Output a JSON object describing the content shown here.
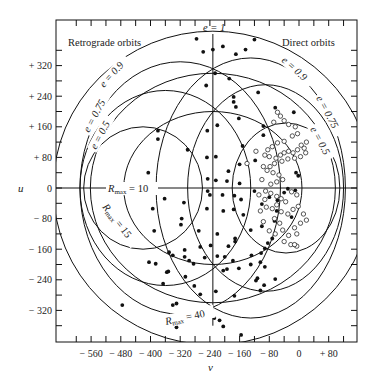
{
  "chart_data": {
    "type": "scatter",
    "title": "",
    "xlabel": "v",
    "ylabel": "u",
    "xlim": [
      -660,
      150
    ],
    "ylim": [
      -405,
      440
    ],
    "x_ticks": [
      -560,
      -480,
      -400,
      -320,
      -240,
      -160,
      -80,
      0,
      80
    ],
    "x_tick_labels": [
      "− 560",
      "− 480",
      "− 400",
      "− 320",
      "− 240",
      "− 160",
      "− 80",
      "0",
      "+ 80"
    ],
    "y_ticks": [
      320,
      240,
      160,
      80,
      0,
      -80,
      -160,
      -240,
      -320
    ],
    "y_tick_labels": [
      "+ 320",
      "+ 240",
      "+ 160",
      "+ 80",
      "0",
      "− 80",
      "− 160",
      "− 240",
      "− 320"
    ],
    "grid": false,
    "region_labels": {
      "retrograde": "Retrograde orbits",
      "direct": "Direct orbits"
    },
    "curve_labels": {
      "e1": "e = 1",
      "e09_left": "e = 0.9",
      "e075_left": "e = 0.75",
      "e05_left": "e = 0.5",
      "e09_right": "e = 0.9",
      "e075_right": "e = 0.75",
      "e05_right": "e = 0.5",
      "rmax10": "R",
      "rmax10_sub": "max",
      "rmax10_val": " = 10",
      "rmax15": "R",
      "rmax15_sub": "max",
      "rmax15_val": " = 15",
      "rmax40": "R",
      "rmax40_sub": "max",
      "rmax40_val": " = 40"
    },
    "reference_lines": {
      "e1_v": -232,
      "u_zero": 0
    },
    "rmax_ellipses": [
      {
        "label": "R_max = 10",
        "center_v": -232,
        "semi_v": 240,
        "semi_u": 200
      },
      {
        "label": "R_max = 15",
        "center_v": -232,
        "semi_v": 330,
        "semi_u": 300
      },
      {
        "label": "R_max = 40",
        "center_v": -232,
        "semi_v": 430,
        "semi_u": 410
      }
    ],
    "eccentricity_curves": [
      {
        "label": "e = 0.5",
        "side": "retrograde",
        "center_v": -420,
        "semi_v": 160,
        "semi_u": 160
      },
      {
        "label": "e = 0.75",
        "side": "retrograde",
        "center_v": -360,
        "semi_v": 230,
        "semi_u": 255
      },
      {
        "label": "e = 0.9",
        "side": "retrograde",
        "center_v": -320,
        "semi_v": 270,
        "semi_u": 330
      },
      {
        "label": "e = 0.5",
        "side": "direct",
        "center_v": -35,
        "semi_v": 145,
        "semi_u": 170
      },
      {
        "label": "e = 0.75",
        "side": "direct",
        "center_v": -90,
        "semi_v": 210,
        "semi_u": 270
      },
      {
        "label": "e = 0.9",
        "side": "direct",
        "center_v": -130,
        "semi_v": 255,
        "semi_u": 340
      }
    ],
    "series": [
      {
        "name": "filled",
        "marker": "filled-circle",
        "points": [
          [
            -276,
            390
          ],
          [
            -205,
            370
          ],
          [
            -232,
            362
          ],
          [
            -258,
            356
          ],
          [
            -170,
            350
          ],
          [
            -144,
            362
          ],
          [
            -120,
            388
          ],
          [
            -226,
            300
          ],
          [
            -250,
            268
          ],
          [
            -188,
            286
          ],
          [
            -176,
            238
          ],
          [
            -176,
            225
          ],
          [
            -110,
            250
          ],
          [
            -64,
            210
          ],
          [
            -14,
            198
          ],
          [
            -380,
            150
          ],
          [
            -380,
            128
          ],
          [
            -300,
            100
          ],
          [
            -96,
            162
          ],
          [
            -170,
            212
          ],
          [
            -162,
            182
          ],
          [
            -220,
            164
          ],
          [
            -247,
            150
          ],
          [
            -96,
            138
          ],
          [
            -152,
            110
          ],
          [
            -224,
            82
          ],
          [
            -248,
            80
          ],
          [
            -118,
            72
          ],
          [
            -160,
            62
          ],
          [
            -190,
            44
          ],
          [
            -406,
            40
          ],
          [
            -246,
            24
          ],
          [
            -224,
            20
          ],
          [
            -194,
            18
          ],
          [
            -160,
            12
          ],
          [
            -246,
            -8
          ],
          [
            -240,
            -18
          ],
          [
            -206,
            -18
          ],
          [
            -174,
            -20
          ],
          [
            -156,
            -30
          ],
          [
            -120,
            -8
          ],
          [
            -80,
            -24
          ],
          [
            -58,
            -32
          ],
          [
            -8,
            40
          ],
          [
            -2,
            32
          ],
          [
            -394,
            -54
          ],
          [
            -362,
            -28
          ],
          [
            -310,
            -38
          ],
          [
            -248,
            -54
          ],
          [
            -176,
            -56
          ],
          [
            -204,
            -60
          ],
          [
            -150,
            -70
          ],
          [
            -100,
            -42
          ],
          [
            -60,
            -60
          ],
          [
            -40,
            -12
          ],
          [
            -30,
            -2
          ],
          [
            -10,
            -6
          ],
          [
            -390,
            -112
          ],
          [
            -316,
            -80
          ],
          [
            -318,
            -96
          ],
          [
            -270,
            -112
          ],
          [
            -220,
            -120
          ],
          [
            -172,
            -132
          ],
          [
            -130,
            -110
          ],
          [
            -100,
            -100
          ],
          [
            -66,
            -86
          ],
          [
            -20,
            -76
          ],
          [
            -10,
            -150
          ],
          [
            -12,
            -148
          ],
          [
            -72,
            -132
          ],
          [
            -350,
            -168
          ],
          [
            -340,
            -176
          ],
          [
            -308,
            -162
          ],
          [
            -266,
            -154
          ],
          [
            -238,
            -150
          ],
          [
            -190,
            -152
          ],
          [
            -172,
            -140
          ],
          [
            -128,
            -176
          ],
          [
            -102,
            -170
          ],
          [
            -92,
            -158
          ],
          [
            -84,
            -144
          ],
          [
            -404,
            -194
          ],
          [
            -386,
            -198
          ],
          [
            -356,
            -220
          ],
          [
            -352,
            -218
          ],
          [
            -308,
            -180
          ],
          [
            -296,
            -190
          ],
          [
            -284,
            -198
          ],
          [
            -254,
            -182
          ],
          [
            -220,
            -178
          ],
          [
            -200,
            -180
          ],
          [
            -178,
            -190
          ],
          [
            -130,
            -200
          ],
          [
            -104,
            -194
          ],
          [
            -92,
            -206
          ],
          [
            -366,
            -250
          ],
          [
            -306,
            -232
          ],
          [
            -282,
            -256
          ],
          [
            -204,
            -216
          ],
          [
            -194,
            -212
          ],
          [
            -162,
            -210
          ],
          [
            -112,
            -236
          ],
          [
            -116,
            -242
          ],
          [
            -104,
            -268
          ],
          [
            -94,
            -254
          ],
          [
            -64,
            -238
          ],
          [
            -476,
            -306
          ],
          [
            -340,
            -306
          ],
          [
            -330,
            -302
          ],
          [
            -266,
            -278
          ],
          [
            -224,
            -270
          ],
          [
            -174,
            -282
          ],
          [
            -228,
            -340
          ],
          [
            -204,
            -362
          ],
          [
            -214,
            -346
          ],
          [
            -156,
            -384
          ],
          [
            -330,
            -364
          ]
        ]
      },
      {
        "name": "open",
        "marker": "open-circle",
        "points": [
          [
            -68,
            172
          ],
          [
            -58,
            198
          ],
          [
            -50,
            188
          ],
          [
            -40,
            176
          ],
          [
            -28,
            166
          ],
          [
            -10,
            160
          ],
          [
            -4,
            142
          ],
          [
            -18,
            136
          ],
          [
            -40,
            122
          ],
          [
            -58,
            118
          ],
          [
            -72,
            108
          ],
          [
            -84,
            100
          ],
          [
            -92,
            86
          ],
          [
            -80,
            82
          ],
          [
            -62,
            78
          ],
          [
            -50,
            86
          ],
          [
            -40,
            92
          ],
          [
            -28,
            96
          ],
          [
            -16,
            92
          ],
          [
            -4,
            100
          ],
          [
            6,
            112
          ],
          [
            14,
            104
          ],
          [
            20,
            120
          ],
          [
            18,
            92
          ],
          [
            4,
            82
          ],
          [
            -12,
            78
          ],
          [
            -30,
            76
          ],
          [
            -46,
            70
          ],
          [
            -66,
            64
          ],
          [
            -78,
            56
          ],
          [
            -86,
            46
          ],
          [
            -70,
            40
          ],
          [
            -54,
            34
          ],
          [
            -44,
            22
          ],
          [
            -60,
            16
          ],
          [
            -76,
            10
          ],
          [
            -90,
            -8
          ],
          [
            -76,
            -14
          ],
          [
            -60,
            -22
          ],
          [
            -48,
            -28
          ],
          [
            -36,
            -36
          ],
          [
            -20,
            -10
          ],
          [
            -6,
            -18
          ],
          [
            -92,
            -30
          ],
          [
            -88,
            -50
          ],
          [
            -72,
            -54
          ],
          [
            -60,
            -44
          ],
          [
            -48,
            -62
          ],
          [
            -30,
            -68
          ],
          [
            -16,
            -56
          ],
          [
            -2,
            -48
          ],
          [
            -66,
            -80
          ],
          [
            -52,
            -92
          ],
          [
            -80,
            -112
          ],
          [
            -64,
            -120
          ],
          [
            -44,
            -110
          ],
          [
            -28,
            -124
          ],
          [
            -12,
            -104
          ],
          [
            4,
            -92
          ],
          [
            20,
            -84
          ],
          [
            12,
            -68
          ],
          [
            -40,
            -140
          ],
          [
            -22,
            -148
          ],
          [
            -6,
            -152
          ],
          [
            -12,
            -148
          ],
          [
            -96,
            -88
          ],
          [
            -104,
            -60
          ],
          [
            -108,
            -18
          ],
          [
            -100,
            22
          ],
          [
            -96,
            56
          ],
          [
            -116,
            96
          ],
          [
            -140,
            64
          ],
          [
            -6,
            -120
          ]
        ]
      }
    ]
  }
}
